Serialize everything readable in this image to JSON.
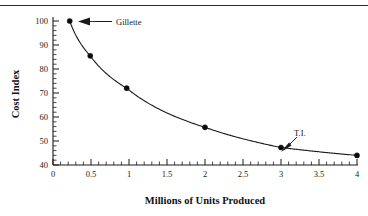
{
  "chart_data": {
    "type": "line",
    "title": "",
    "xlabel": "Millions of Units Produced",
    "ylabel": "Cost Index",
    "xlim": [
      0,
      4.15
    ],
    "ylim": [
      40,
      102
    ],
    "grid": false,
    "legend": "none",
    "x_ticks": [
      "0",
      "0.5",
      "1",
      "1.5",
      "2",
      "2.5",
      "3",
      "3.5",
      "4"
    ],
    "x_tick_values": [
      0,
      0.5,
      1,
      1.5,
      2,
      2.5,
      3,
      3.5,
      4
    ],
    "y_ticks": [
      "40",
      "50",
      "60",
      "70",
      "80",
      "90",
      "100"
    ],
    "y_tick_values": [
      40,
      50,
      60,
      70,
      80,
      90,
      100
    ],
    "x_minor_step": 0.1,
    "y_minor_step": 2,
    "series": [
      {
        "name": "Cost Index curve",
        "x": [
          0.22,
          0.49,
          0.97,
          2.0,
          3.0,
          4.0
        ],
        "values": [
          100,
          85.5,
          72,
          55.7,
          47.3,
          44
        ]
      }
    ],
    "annotations": [
      {
        "label": "Gillette",
        "point_x": 0.22,
        "point_y": 100,
        "label_x": 0.86,
        "label_y": 100.5,
        "arrow": "left"
      },
      {
        "label": "T.I.",
        "point_x": 3.0,
        "point_y": 47.3,
        "label_x": 3.3,
        "label_y": 52.5,
        "arrow": "down-left"
      }
    ]
  },
  "axis": {
    "x_title": "Millions of Units Produced",
    "y_title": "Cost Index"
  },
  "ticks": {
    "x": [
      "0",
      "0.5",
      "1",
      "1.5",
      "2",
      "2.5",
      "3",
      "3.5",
      "4"
    ],
    "y": [
      "40",
      "50",
      "60",
      "70",
      "80",
      "90",
      "100"
    ]
  },
  "annotations": {
    "gillette": "Gillette",
    "ti": "T.I."
  },
  "colors": {
    "ink": "#1a1a1a",
    "marker": "#0d0d0d",
    "rule": "#2b2b2b",
    "background": "#ffffff"
  }
}
